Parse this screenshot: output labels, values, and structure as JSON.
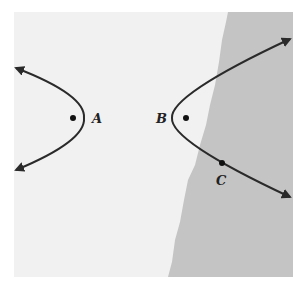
{
  "figure": {
    "colors": {
      "background": "#f1f1f1",
      "shaded_region": "#c4c4c4",
      "curve": "#2a2a2a"
    },
    "points": [
      {
        "label": "A",
        "position": "focus inside left branch"
      },
      {
        "label": "B",
        "position": "focus inside right branch"
      },
      {
        "label": "C",
        "position": "on lower arm of right branch"
      }
    ],
    "labels": {
      "A": "A",
      "B": "B",
      "C": "C"
    }
  }
}
